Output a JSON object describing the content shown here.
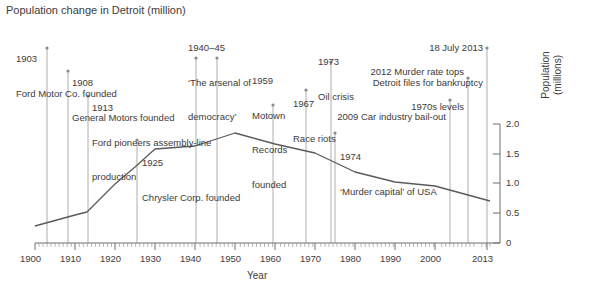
{
  "chart_title": "Population change in Detroit (million)",
  "axes": {
    "x_title": "Year",
    "y_title_line1": "Population",
    "y_title_line2": "(millions)",
    "x_ticks": [
      "1900",
      "1910",
      "1920",
      "1930",
      "1940",
      "1950",
      "1960",
      "1970",
      "1980",
      "1990",
      "2000",
      "2013"
    ],
    "y_ticks": [
      "0",
      "0.5",
      "1.0",
      "1.5",
      "2.0"
    ]
  },
  "annotations": [
    {
      "id": "a1903",
      "year_label": "1903",
      "text": "Ford Motor Co. founded",
      "align": "left"
    },
    {
      "id": "a1908",
      "year_label": "1908",
      "text": "General Motors founded",
      "align": "left"
    },
    {
      "id": "a1913",
      "year_label": "1913",
      "text_line1": "Ford pioneers assembly-line",
      "text_line2": "production",
      "align": "left"
    },
    {
      "id": "a1925",
      "year_label": "1925",
      "text": "Chrysler Corp. founded",
      "align": "left"
    },
    {
      "id": "a1940",
      "year_label": "1940–45",
      "text_line1": "‘The arsenal of",
      "text_line2": "democracy’",
      "align": "left"
    },
    {
      "id": "a1959",
      "year_label": "1959",
      "text_line1": "Motown",
      "text_line2": "Records",
      "text_line3": "founded",
      "align": "left"
    },
    {
      "id": "a1967",
      "year_label": "1967",
      "text": "Race riots",
      "align": "left"
    },
    {
      "id": "a1973",
      "year_label": "1973",
      "text": "Oil crisis",
      "align": "left"
    },
    {
      "id": "a1974",
      "year_label": "1974",
      "text": "‘Murder capital’ of USA",
      "align": "left"
    },
    {
      "id": "a2009",
      "text": "2009 Car industry bail-out",
      "align": "right"
    },
    {
      "id": "a2012",
      "text_line1": "2012 Murder rate tops",
      "text_line2": "1970s levels",
      "align": "right"
    },
    {
      "id": "a2013",
      "year_label": "18 July 2013",
      "text": "Detroit files for bankruptcy",
      "align": "right"
    }
  ],
  "chart_data": {
    "type": "line",
    "title": "Population change in Detroit (million)",
    "xlabel": "Year",
    "ylabel": "Population (millions)",
    "xlim": [
      1900,
      2013
    ],
    "ylim": [
      0,
      2.0
    ],
    "grid": false,
    "legend": "none",
    "series": [
      {
        "name": "Detroit population",
        "x": [
          1900,
          1910,
          1913,
          1920,
          1925,
          1930,
          1940,
          1950,
          1960,
          1970,
          1980,
          1990,
          2000,
          2013
        ],
        "y": [
          0.29,
          0.47,
          0.52,
          0.99,
          1.27,
          1.57,
          1.62,
          1.85,
          1.67,
          1.51,
          1.2,
          1.03,
          0.95,
          0.7
        ]
      }
    ],
    "event_markers": [
      {
        "year": 1903,
        "label": "Ford Motor Co. founded"
      },
      {
        "year": 1908,
        "label": "General Motors founded"
      },
      {
        "year": 1913,
        "label": "Ford pioneers assembly-line production"
      },
      {
        "year": 1925,
        "label": "Chrysler Corp. founded"
      },
      {
        "year": 1940,
        "label": "'The arsenal of democracy'"
      },
      {
        "year": 1945,
        "label": "'The arsenal of democracy'"
      },
      {
        "year": 1959,
        "label": "Motown Records founded"
      },
      {
        "year": 1967,
        "label": "Race riots"
      },
      {
        "year": 1973,
        "label": "Oil crisis"
      },
      {
        "year": 1974,
        "label": "'Murder capital' of USA"
      },
      {
        "year": 2009,
        "label": "Car industry bail-out"
      },
      {
        "year": 2012,
        "label": "Murder rate tops 1970s levels"
      },
      {
        "year": 2013,
        "label": "Detroit files for bankruptcy"
      }
    ]
  },
  "colors": {
    "line": "#5a5a5a",
    "axis": "#6e6e6e",
    "leader": "#9a9a9a",
    "text": "#3b3b3b",
    "background": "#ffffff"
  }
}
